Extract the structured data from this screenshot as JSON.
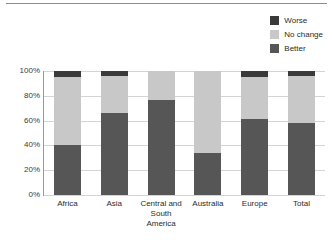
{
  "chart_data": {
    "type": "bar",
    "subtype": "100% stacked bar",
    "title": "",
    "xlabel": "",
    "ylabel": "",
    "ylim": [
      0,
      100
    ],
    "yticks": [
      "0%",
      "20%",
      "40%",
      "60%",
      "80%",
      "100%"
    ],
    "ytick_values": [
      0,
      20,
      40,
      60,
      80,
      100
    ],
    "grid": "horizontal",
    "legend_position": "top-right",
    "categories": [
      "Africa",
      "Central and South America",
      "Asia",
      "Australia",
      "Europe",
      "Total"
    ],
    "category_lines": [
      [
        "Africa"
      ],
      [
        "Asia"
      ],
      [
        "Central and",
        "South America"
      ],
      [
        "Australia"
      ],
      [
        "Europe"
      ],
      [
        "Total"
      ]
    ],
    "series": [
      {
        "name": "Better",
        "color": "#565656",
        "values": [
          40,
          66,
          77,
          34,
          61,
          58
        ]
      },
      {
        "name": "No change",
        "color": "#c8c8c8",
        "values": [
          55,
          30,
          23,
          66,
          34,
          38
        ]
      },
      {
        "name": "Worse",
        "color": "#3a3a3a",
        "values": [
          5,
          4,
          0,
          0,
          5,
          4
        ]
      }
    ],
    "stack_order_bottom_to_top": [
      "Better",
      "No change",
      "Worse"
    ]
  },
  "legend": {
    "items": [
      {
        "label": "Worse",
        "color": "#3a3a3a"
      },
      {
        "label": "No change",
        "color": "#c8c8c8"
      },
      {
        "label": "Better",
        "color": "#565656"
      }
    ]
  }
}
